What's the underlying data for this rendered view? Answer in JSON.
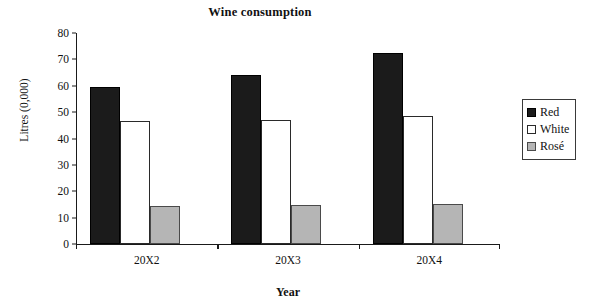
{
  "chart_data": {
    "type": "bar",
    "title": "Wine consumption",
    "xlabel": "Year",
    "ylabel": "Litres (0,000)",
    "categories": [
      "20X2",
      "20X3",
      "20X4"
    ],
    "series": [
      {
        "name": "Red",
        "color": "#1b1b1b",
        "values": [
          59.5,
          64.0,
          72.5
        ]
      },
      {
        "name": "White",
        "color": "#ffffff",
        "values": [
          46.5,
          47.0,
          48.5
        ]
      },
      {
        "name": "Rosé",
        "color": "#b5b5b5",
        "values": [
          14.3,
          14.8,
          15.0
        ]
      }
    ],
    "ylim": [
      0,
      80
    ],
    "yticks": [
      0,
      10,
      20,
      30,
      40,
      50,
      60,
      70,
      80
    ],
    "ytick_labels": [
      "0",
      "10",
      "20",
      "30",
      "40",
      "50",
      "60",
      "70",
      "80"
    ],
    "grid": false,
    "legend_position": "right"
  },
  "legend": {
    "entries": [
      {
        "label": "Red"
      },
      {
        "label": "White"
      },
      {
        "label": "Rosé"
      }
    ]
  }
}
